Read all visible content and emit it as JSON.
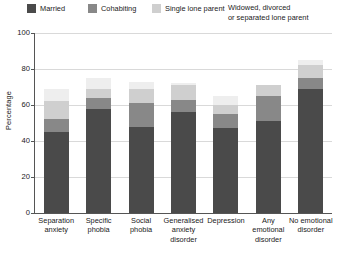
{
  "legend": {
    "items": [
      {
        "label": "Married",
        "label2": "",
        "color": "#4a4a4a",
        "name": "married"
      },
      {
        "label": "Cohabiting",
        "label2": "",
        "color": "#888888",
        "name": "cohabiting"
      },
      {
        "label": "Single lone parent",
        "label2": "",
        "color": "#cfcfcf",
        "name": "single-lone-parent"
      },
      {
        "label": "Widowed, divorced",
        "label2": "or separated lone parent",
        "color": "#eeeeee",
        "name": "widowed-divorced-separated-lone-parent"
      }
    ]
  },
  "axes": {
    "ylabel": "Percentage",
    "yticks": [
      "100",
      "80",
      "60",
      "40",
      "20",
      "0"
    ]
  },
  "chart_data": {
    "type": "bar",
    "title": "",
    "xlabel": "",
    "ylabel": "Percentage",
    "ylim": [
      0,
      100
    ],
    "grid": true,
    "stacked": true,
    "legend_position": "top",
    "categories": [
      "Separation anxiety",
      "Specific phobia",
      "Social phobia",
      "Generalised anxiety disorder",
      "Depression",
      "Any emotional disorder",
      "No emotional disorder"
    ],
    "category_lines": [
      [
        "Separation",
        "anxiety"
      ],
      [
        "Specific",
        "phobia"
      ],
      [
        "Social",
        "phobia"
      ],
      [
        "Generalised",
        "anxiety",
        "disorder"
      ],
      [
        "Depression"
      ],
      [
        "Any",
        "emotional",
        "disorder"
      ],
      [
        "No emotional",
        "disorder"
      ]
    ],
    "series": [
      {
        "name": "Married",
        "color": "#4a4a4a",
        "values": [
          45,
          58,
          48,
          56,
          47,
          51,
          69
        ]
      },
      {
        "name": "Cohabiting",
        "color": "#888888",
        "values": [
          7,
          6,
          13,
          7,
          8,
          14,
          6
        ]
      },
      {
        "name": "Single lone parent",
        "color": "#cfcfcf",
        "values": [
          10,
          5,
          8,
          8,
          5,
          6,
          7
        ]
      },
      {
        "name": "Widowed, divorced or separated lone parent",
        "color": "#eeeeee",
        "values": [
          7,
          6,
          4,
          1,
          5,
          0,
          3
        ]
      }
    ],
    "totals": [
      69,
      75,
      73,
      72,
      65,
      71,
      85
    ]
  }
}
